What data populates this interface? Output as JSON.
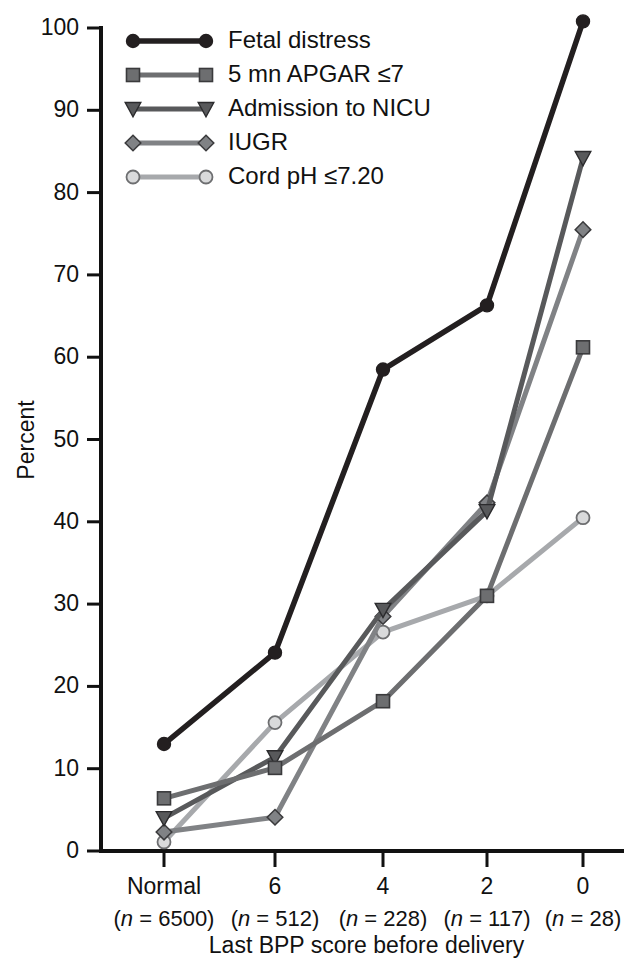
{
  "chart_data": {
    "type": "line",
    "title": "",
    "xlabel": "Last BPP score before delivery",
    "ylabel": "Percent",
    "ylim": [
      0,
      100
    ],
    "yticks": [
      0,
      10,
      20,
      30,
      40,
      50,
      60,
      70,
      80,
      90,
      100
    ],
    "grid": false,
    "legend_position": "top-left inside",
    "categories": [
      "Normal",
      "6",
      "4",
      "2",
      "0"
    ],
    "category_sublabels": [
      "(n = 6500)",
      "(n = 512)",
      "(n = 228)",
      "(n = 117)",
      "(n = 28)"
    ],
    "category_n": [
      6500,
      512,
      228,
      117,
      28
    ],
    "series": [
      {
        "name": "Fetal distress",
        "marker": "circle",
        "color": "#231f20",
        "values": [
          13.0,
          24.1,
          58.5,
          66.3,
          100.8
        ]
      },
      {
        "name": "5 mn APGAR ≤7",
        "marker": "square",
        "color": "#6d6e70",
        "values": [
          6.4,
          10.1,
          18.2,
          31.0,
          61.2
        ]
      },
      {
        "name": "Admission to NICU",
        "marker": "triangle-down",
        "color": "#58595b",
        "values": [
          4.0,
          11.4,
          29.3,
          41.3,
          84.2
        ]
      },
      {
        "name": "IUGR",
        "marker": "diamond",
        "color": "#808285",
        "values": [
          2.3,
          4.1,
          28.5,
          42.3,
          75.5
        ]
      },
      {
        "name": "Cord pH ≤7.20",
        "marker": "circle-open",
        "color": "#a7a9ac",
        "values": [
          1.1,
          15.6,
          26.6,
          31.0,
          40.5
        ]
      }
    ]
  },
  "legend": {
    "items": [
      {
        "label": "Fetal distress"
      },
      {
        "label": "5 mn APGAR ≤7"
      },
      {
        "label": "Admission to NICU"
      },
      {
        "label": "IUGR"
      },
      {
        "label": "Cord pH ≤7.20"
      }
    ]
  },
  "axes": {
    "y_title": "Percent",
    "x_title": "Last BPP score before delivery"
  }
}
